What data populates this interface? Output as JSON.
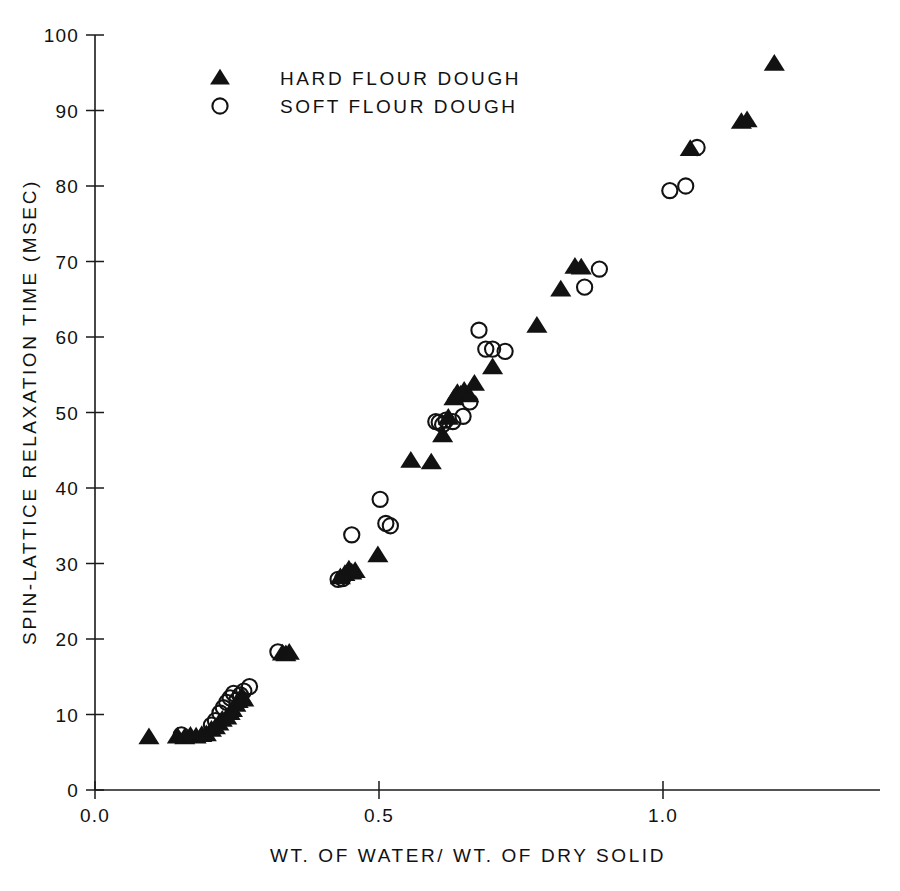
{
  "figure": {
    "background": "#ffffff",
    "ink_color": "#121212"
  },
  "chart_data": {
    "type": "scatter",
    "title": "",
    "xlabel": "WT. OF WATER/ WT. OF DRY SOLID",
    "ylabel": "SPIN-LATTICE RELAXATION TIME (MSEC)",
    "xlim": [
      0.0,
      1.28
    ],
    "ylim": [
      0,
      100
    ],
    "xticks": [
      0.0,
      0.5,
      1.0
    ],
    "xtick_labels": [
      "0.0",
      "0.5",
      "1.0"
    ],
    "yticks": [
      0,
      10,
      20,
      30,
      40,
      50,
      60,
      70,
      80,
      90,
      100
    ],
    "ytick_labels": [
      "0",
      "10",
      "20",
      "30",
      "40",
      "50",
      "60",
      "70",
      "80",
      "90",
      "100"
    ],
    "grid": false,
    "legend_position": "top-left-inside",
    "series": [
      {
        "name": "HARD FLOUR DOUGH",
        "marker": "filled-triangle",
        "color": "#121212",
        "points": [
          [
            0.095,
            7.0
          ],
          [
            0.145,
            7.1
          ],
          [
            0.158,
            7.0
          ],
          [
            0.168,
            7.2
          ],
          [
            0.178,
            7.1
          ],
          [
            0.188,
            7.3
          ],
          [
            0.196,
            7.4
          ],
          [
            0.205,
            8.0
          ],
          [
            0.212,
            8.3
          ],
          [
            0.218,
            8.8
          ],
          [
            0.224,
            9.3
          ],
          [
            0.232,
            9.6
          ],
          [
            0.238,
            10.2
          ],
          [
            0.242,
            10.6
          ],
          [
            0.248,
            11.3
          ],
          [
            0.252,
            11.8
          ],
          [
            0.258,
            12.4
          ],
          [
            0.262,
            12.0
          ],
          [
            0.33,
            18.1
          ],
          [
            0.336,
            18.0
          ],
          [
            0.342,
            18.2
          ],
          [
            0.432,
            28.2
          ],
          [
            0.44,
            28.6
          ],
          [
            0.447,
            29.2
          ],
          [
            0.452,
            28.8
          ],
          [
            0.458,
            29.0
          ],
          [
            0.498,
            31.1
          ],
          [
            0.556,
            43.6
          ],
          [
            0.592,
            43.4
          ],
          [
            0.612,
            47.0
          ],
          [
            0.622,
            49.3
          ],
          [
            0.632,
            51.9
          ],
          [
            0.638,
            52.6
          ],
          [
            0.644,
            52.4
          ],
          [
            0.65,
            52.9
          ],
          [
            0.658,
            52.3
          ],
          [
            0.668,
            53.8
          ],
          [
            0.7,
            56.0
          ],
          [
            0.778,
            61.5
          ],
          [
            0.82,
            66.3
          ],
          [
            0.845,
            69.3
          ],
          [
            0.856,
            69.2
          ],
          [
            1.048,
            84.9
          ],
          [
            1.138,
            88.5
          ],
          [
            1.148,
            88.7
          ],
          [
            1.196,
            96.2
          ]
        ]
      },
      {
        "name": "SOFT FLOUR DOUGH",
        "marker": "open-circle",
        "color": "#121212",
        "points": [
          [
            0.152,
            7.3
          ],
          [
            0.205,
            8.6
          ],
          [
            0.212,
            9.2
          ],
          [
            0.22,
            10.2
          ],
          [
            0.226,
            10.9
          ],
          [
            0.232,
            11.6
          ],
          [
            0.238,
            12.2
          ],
          [
            0.244,
            12.8
          ],
          [
            0.25,
            11.9
          ],
          [
            0.256,
            12.6
          ],
          [
            0.262,
            13.1
          ],
          [
            0.272,
            13.7
          ],
          [
            0.322,
            18.3
          ],
          [
            0.428,
            27.9
          ],
          [
            0.436,
            28.0
          ],
          [
            0.452,
            33.8
          ],
          [
            0.502,
            38.5
          ],
          [
            0.512,
            35.3
          ],
          [
            0.52,
            35.0
          ],
          [
            0.6,
            48.8
          ],
          [
            0.606,
            48.7
          ],
          [
            0.612,
            48.4
          ],
          [
            0.618,
            49.0
          ],
          [
            0.63,
            48.8
          ],
          [
            0.648,
            49.5
          ],
          [
            0.66,
            51.4
          ],
          [
            0.676,
            60.9
          ],
          [
            0.688,
            58.4
          ],
          [
            0.7,
            58.4
          ],
          [
            0.722,
            58.1
          ],
          [
            0.862,
            66.6
          ],
          [
            0.888,
            69.0
          ],
          [
            1.012,
            79.4
          ],
          [
            1.04,
            80.0
          ],
          [
            1.06,
            85.1
          ]
        ]
      }
    ]
  },
  "legend": {
    "entries": [
      {
        "label": "HARD FLOUR DOUGH",
        "marker": "filled-triangle"
      },
      {
        "label": "SOFT FLOUR DOUGH",
        "marker": "open-circle"
      }
    ]
  }
}
